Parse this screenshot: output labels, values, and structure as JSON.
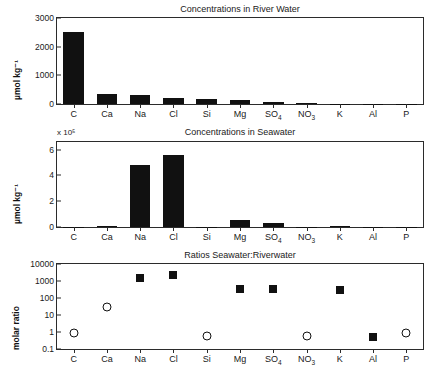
{
  "chart_data": [
    {
      "type": "bar",
      "id": "river",
      "title": "Concentrations in River Water",
      "xlabel": "",
      "ylabel": "µmol kg⁻¹",
      "categories": [
        "C",
        "Ca",
        "Na",
        "Cl",
        "Si",
        "Mg",
        "SO₄",
        "NO₃",
        "K",
        "Al",
        "P"
      ],
      "categories_html": [
        "C",
        "Ca",
        "Na",
        "Cl",
        "Si",
        "Mg",
        "SO<sub>4</sub>",
        "NO<sub>3</sub>",
        "K",
        "Al",
        "P"
      ],
      "values": [
        2500,
        350,
        300,
        220,
        190,
        150,
        80,
        40,
        15,
        5,
        2
      ],
      "ylim": [
        0,
        3000
      ],
      "yticks": [
        0,
        1000,
        2000,
        3000
      ],
      "ytick_labels": [
        "0",
        "1000",
        "2000",
        "3000"
      ],
      "grid": false,
      "legend": "none"
    },
    {
      "type": "bar",
      "id": "seawater",
      "title": "Concentrations in Seawater",
      "xlabel": "",
      "ylabel": "µmol kg⁻¹",
      "exponent_label": "x 10⁵",
      "categories": [
        "C",
        "Ca",
        "Na",
        "Cl",
        "Si",
        "Mg",
        "SO₄",
        "NO₃",
        "K",
        "Al",
        "P"
      ],
      "categories_html": [
        "C",
        "Ca",
        "Na",
        "Cl",
        "Si",
        "Mg",
        "SO<sub>4</sub>",
        "NO<sub>3</sub>",
        "K",
        "Al",
        "P"
      ],
      "values": [
        0.02,
        0.103,
        4.8,
        5.6,
        0.001,
        0.53,
        0.28,
        0.0003,
        0.105,
        0.0001,
        3e-05
      ],
      "ylim": [
        0,
        6.6
      ],
      "yticks": [
        0,
        2,
        4,
        6
      ],
      "ytick_labels": [
        "0",
        "2",
        "4",
        "6"
      ],
      "grid": false,
      "legend": "none"
    },
    {
      "type": "scatter",
      "id": "ratios",
      "title": "Ratios Seawater:Riverwater",
      "xlabel": "",
      "ylabel": "molar ratio",
      "yscale": "log",
      "categories": [
        "C",
        "Ca",
        "Na",
        "Cl",
        "Si",
        "Mg",
        "SO₄",
        "NO₃",
        "K",
        "Al",
        "P"
      ],
      "categories_html": [
        "C",
        "Ca",
        "Na",
        "Cl",
        "Si",
        "Mg",
        "SO<sub>4</sub>",
        "NO<sub>3</sub>",
        "K",
        "Al",
        "P"
      ],
      "values": [
        0.9,
        29,
        1600,
        2400,
        0.55,
        350,
        330,
        0.55,
        300,
        0.52,
        0.9
      ],
      "markers": [
        "circle",
        "circle",
        "square",
        "square",
        "circle",
        "square",
        "square",
        "circle",
        "square",
        "square",
        "circle"
      ],
      "ylim": [
        0.1,
        10000
      ],
      "yticks": [
        0.1,
        1,
        10,
        100,
        1000,
        10000
      ],
      "ytick_labels": [
        "0.1",
        "1",
        "10",
        "100",
        "1000",
        "10000"
      ],
      "grid": false,
      "legend": "none"
    }
  ]
}
